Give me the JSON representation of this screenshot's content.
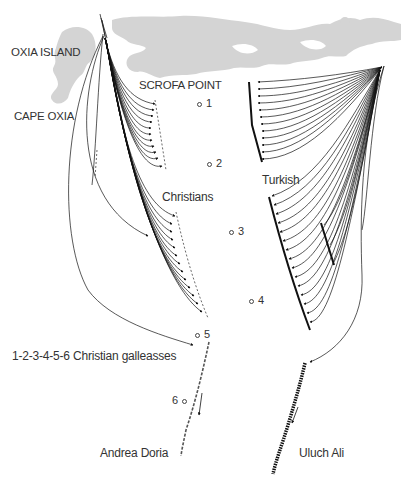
{
  "diagram": {
    "colors": {
      "land": "#d4d4d4",
      "lines": "#111111",
      "text": "#333333",
      "background": "#ffffff"
    },
    "labels": {
      "oxia_island": "OXIA ISLAND",
      "cape_oxia": "CAPE OXIA",
      "scrofa_point": "SCROFA POINT",
      "christians": "Christians",
      "turkish": "Turkish",
      "galleasses_legend": "1-2-3-4-5-6 Christian galleasses",
      "andrea_doria": "Andrea Doria",
      "uluch_ali": "Uluch Ali"
    },
    "galleasses": [
      {
        "number": "1",
        "x": 200,
        "y": 97,
        "label_side": "right"
      },
      {
        "number": "2",
        "x": 210,
        "y": 158,
        "label_side": "right"
      },
      {
        "number": "3",
        "x": 232,
        "y": 226,
        "label_side": "right"
      },
      {
        "number": "4",
        "x": 252,
        "y": 295,
        "label_side": "right"
      },
      {
        "number": "5",
        "x": 198,
        "y": 330,
        "label_side": "right"
      },
      {
        "number": "6",
        "x": 175,
        "y": 400,
        "label_side": "left"
      }
    ]
  }
}
